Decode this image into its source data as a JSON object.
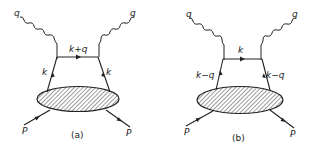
{
  "figure": {
    "panels": [
      {
        "id": "a",
        "caption": "(a)",
        "labels": {
          "photon_in": "q",
          "photon_out": "q",
          "top_propagator": "k+q",
          "left_leg": "k",
          "right_leg": "k",
          "proton_in": "P",
          "proton_out": "P"
        }
      },
      {
        "id": "b",
        "caption": "(b)",
        "labels": {
          "photon_in": "q",
          "photon_out": "q",
          "top_propagator": "k",
          "left_leg": "k−q",
          "right_leg": "k−q",
          "proton_in": "P",
          "proton_out": "P"
        }
      }
    ],
    "colors": {
      "ink": "#222222",
      "background": "#ffffff"
    }
  }
}
